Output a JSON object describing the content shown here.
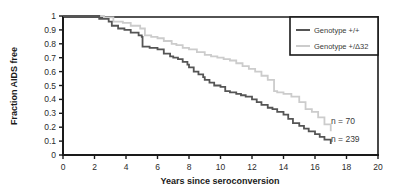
{
  "chart_data": {
    "type": "line",
    "title": "",
    "xlabel": "Years since seroconversion",
    "ylabel": "Fraction AIDS free",
    "xlim": [
      0,
      20
    ],
    "ylim": [
      0,
      1
    ],
    "xticks": [
      0,
      2,
      4,
      6,
      8,
      10,
      12,
      14,
      16,
      18,
      20
    ],
    "xtick_labels": [
      "0",
      "2",
      "4",
      "6",
      "8",
      "10",
      "12",
      "14",
      "16",
      "18",
      "20"
    ],
    "yticks": [
      0,
      0.1,
      0.2,
      0.3,
      0.4,
      0.5,
      0.6,
      0.7,
      0.8,
      0.9,
      1
    ],
    "ytick_labels": [
      "0",
      "0.1",
      "0.2",
      "0.3",
      "0.4",
      "0.5",
      "0.6",
      "0.7",
      "0.8",
      "0.9",
      "1"
    ],
    "grid": false,
    "legend_position": "top-right",
    "step_style": "post",
    "series": [
      {
        "name": "Genotype +/+",
        "color": "#555555",
        "n_label": "n = 239",
        "n_value": 239,
        "x": [
          0,
          2.0,
          2.3,
          2.9,
          3.1,
          3.5,
          3.9,
          4.3,
          4.8,
          5.0,
          5.05,
          5.5,
          6.0,
          6.4,
          6.8,
          7.0,
          7.3,
          7.6,
          7.9,
          8.0,
          8.3,
          8.6,
          8.9,
          9.0,
          9.3,
          9.6,
          10.0,
          10.3,
          10.6,
          11.0,
          11.3,
          11.6,
          12.0,
          12.3,
          12.6,
          13.0,
          13.3,
          13.6,
          14.0,
          14.3,
          14.6,
          15.0,
          15.3,
          15.6,
          16.0,
          16.3,
          16.6,
          17.0
        ],
        "y": [
          1.0,
          1.0,
          0.98,
          0.96,
          0.93,
          0.91,
          0.9,
          0.88,
          0.86,
          0.85,
          0.78,
          0.77,
          0.76,
          0.73,
          0.71,
          0.7,
          0.69,
          0.67,
          0.65,
          0.63,
          0.6,
          0.58,
          0.56,
          0.54,
          0.52,
          0.5,
          0.49,
          0.46,
          0.45,
          0.44,
          0.43,
          0.42,
          0.4,
          0.38,
          0.36,
          0.34,
          0.33,
          0.31,
          0.29,
          0.26,
          0.23,
          0.21,
          0.19,
          0.17,
          0.15,
          0.13,
          0.11,
          0.08
        ]
      },
      {
        "name": "Genotype +/Δ32",
        "color": "#cccccc",
        "n_label": "n = 70",
        "n_value": 70,
        "x": [
          0,
          2.0,
          2.6,
          3.2,
          3.8,
          4.3,
          4.9,
          5.2,
          5.6,
          6.0,
          6.4,
          6.9,
          7.2,
          7.6,
          8.0,
          8.5,
          9.0,
          9.4,
          9.8,
          10.2,
          10.6,
          11.0,
          11.4,
          11.8,
          12.2,
          12.6,
          13.0,
          13.4,
          13.6,
          14.0,
          14.5,
          15.0,
          15.4,
          15.8,
          16.2,
          16.6,
          17.0
        ],
        "y": [
          1.0,
          1.0,
          0.99,
          0.96,
          0.95,
          0.93,
          0.91,
          0.86,
          0.85,
          0.84,
          0.82,
          0.8,
          0.79,
          0.77,
          0.76,
          0.74,
          0.72,
          0.71,
          0.7,
          0.69,
          0.68,
          0.66,
          0.64,
          0.62,
          0.6,
          0.57,
          0.54,
          0.46,
          0.45,
          0.44,
          0.42,
          0.38,
          0.33,
          0.31,
          0.27,
          0.22,
          0.17
        ]
      }
    ]
  },
  "legend": {
    "entries": [
      {
        "label": "Genotype +/+",
        "color": "#555555"
      },
      {
        "label": "Genotype +/Δ32",
        "color": "#cccccc"
      }
    ]
  },
  "annotations": [
    {
      "text": "n = 70"
    },
    {
      "text": "n = 239"
    }
  ],
  "style": {
    "axis_color": "#1a1a1a",
    "background": "#ffffff",
    "text_color": "#2b2b2b"
  }
}
